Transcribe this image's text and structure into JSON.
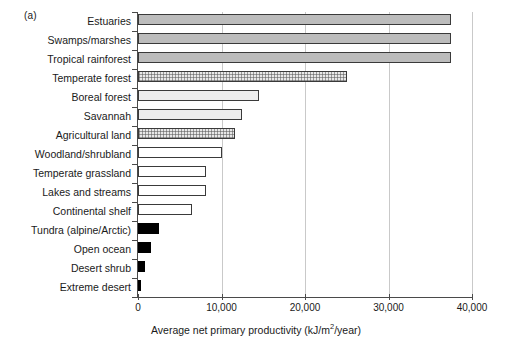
{
  "panel_label": "(a)",
  "axis_title_prefix": "Average net primary productivity (kJ/m",
  "axis_title_sup": "2",
  "axis_title_suffix": "/year)",
  "xticks": [
    {
      "label": "0",
      "value": 0
    },
    {
      "label": "10,000",
      "value": 10000
    },
    {
      "label": "20,000",
      "value": 20000
    },
    {
      "label": "30,000",
      "value": 30000
    },
    {
      "label": "40,000",
      "value": 40000
    }
  ],
  "chart_data": {
    "type": "bar",
    "orientation": "horizontal",
    "title": "",
    "subtitle": "",
    "panel": "(a)",
    "xlabel": "Average net primary productivity (kJ/m2/year)",
    "ylabel": "",
    "xlim": [
      0,
      40000
    ],
    "xticks": [
      0,
      10000,
      20000,
      30000,
      40000
    ],
    "grid": "vertical-major",
    "legend": "none",
    "categories": [
      "Estuaries",
      "Swamps/marshes",
      "Tropical rainforest",
      "Temperate forest",
      "Boreal forest",
      "Savannah",
      "Agricultural land",
      "Woodland/shrubland",
      "Temperate grassland",
      "Lakes and streams",
      "Continental shelf",
      "Tundra (alpine/Arctic)",
      "Open ocean",
      "Desert shrub",
      "Extreme desert"
    ],
    "values": [
      37500,
      37500,
      37500,
      25000,
      14500,
      12400,
      11600,
      10000,
      8200,
      8200,
      6500,
      2500,
      1600,
      800,
      300
    ],
    "bar_styles": [
      "solid-gray",
      "solid-gray",
      "solid-gray",
      "stippled-light",
      "light-gray",
      "light-gray",
      "stippled-light",
      "white",
      "white",
      "white",
      "white",
      "black",
      "black",
      "black",
      "black"
    ]
  }
}
